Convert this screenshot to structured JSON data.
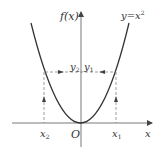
{
  "diagram": {
    "function_label": "y=x²",
    "function_base": "y=x",
    "function_exp": "2",
    "y_axis_label": "f(x)",
    "x_axis_label": "x",
    "origin_label": "O",
    "points": {
      "x1_base": "x",
      "x1_sub": "1",
      "x2_base": "x",
      "x2_sub": "2",
      "y1_base": "y",
      "y1_sub": "1",
      "y2_base": "y",
      "y2_sub": "2"
    },
    "colors": {
      "curve": "#333333",
      "axes": "#555555",
      "dashed": "#777777",
      "background": "#ffffff"
    }
  }
}
